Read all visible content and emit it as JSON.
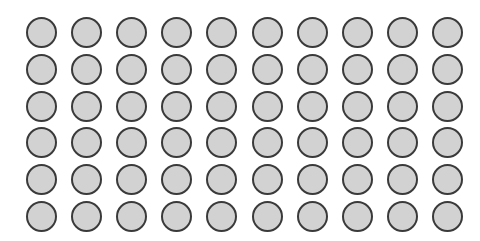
{
  "grid": {
    "rows": 6,
    "cols": 10,
    "origin_x": 26,
    "origin_y": 17,
    "pitch_x": 45.1,
    "pitch_y": 36.8,
    "fill_color": "#d2d2d2",
    "border_color": "#3a3a3a",
    "shape": "circle"
  }
}
